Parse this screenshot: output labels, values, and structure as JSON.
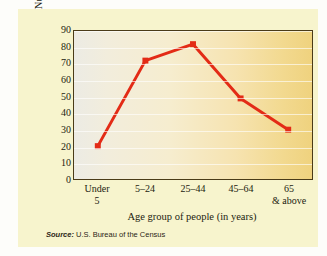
{
  "card": {
    "background_color": "#f7f4cd",
    "source_keyword": "Source:",
    "source_text": "U.S. Bureau of the Census"
  },
  "chart_data": {
    "type": "line",
    "title": "",
    "subtitle": "",
    "xlabel": "Age group of people (in years)",
    "ylabel_line1": "Number of people",
    "ylabel_line2": "(in millions)",
    "ylabel": "Number of people (in millions)",
    "categories": [
      "Under 5",
      "5–24",
      "25–44",
      "45–64",
      "65 & above"
    ],
    "category_lines": [
      {
        "l1": "Under",
        "l2": "5"
      },
      {
        "l1": "5–24",
        "l2": ""
      },
      {
        "l1": "25–44",
        "l2": ""
      },
      {
        "l1": "45–64",
        "l2": ""
      },
      {
        "l1": "65",
        "l2": "& above"
      }
    ],
    "values": [
      20,
      72,
      82,
      49,
      30
    ],
    "ylim": [
      0,
      90
    ],
    "yticks": [
      0,
      10,
      20,
      30,
      40,
      50,
      60,
      70,
      80,
      90
    ],
    "ytick_labels": [
      "0",
      "10",
      "20",
      "30",
      "40",
      "50",
      "60",
      "70",
      "80",
      "90"
    ],
    "grid": true,
    "legend": false,
    "series_color": "#e32b16",
    "marker": "square",
    "axis_color": "#4a3b18",
    "plot_gradient_from": "#ecebe4",
    "plot_gradient_to": "#efd27e"
  }
}
